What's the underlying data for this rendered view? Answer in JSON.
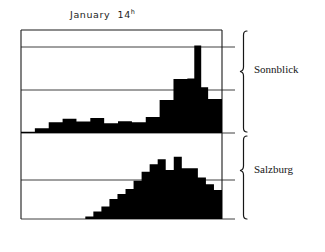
{
  "figure": {
    "title_main": "January",
    "title_day": "14",
    "title_sup": "h"
  },
  "panels": {
    "upper": {
      "label": "Sonnblick"
    },
    "lower": {
      "label": "Salzburg"
    }
  },
  "colors": {
    "bar_fill": "#000000",
    "frame": "#1a1a1a",
    "gridline": "#2b2b2b",
    "background": "#ffffff"
  },
  "chart_data": [
    {
      "type": "bar",
      "title": "January 14h",
      "series_name": "Sonnblick",
      "xlabel": "",
      "ylabel": "",
      "grid": true,
      "legend_position": "right",
      "ylim": [
        0,
        4
      ],
      "gridline_values": [
        1,
        3,
        4
      ],
      "categories": [
        "1",
        "2",
        "3",
        "4",
        "5",
        "6",
        "7",
        "8",
        "9",
        "10",
        "11",
        "12",
        "13",
        "14",
        "15",
        "16",
        "17",
        "18",
        "19",
        "20",
        "21",
        "22",
        "23",
        "24"
      ],
      "values": [
        0.05,
        0.05,
        0.18,
        0.18,
        0.42,
        0.42,
        0.55,
        0.55,
        0.45,
        0.45,
        0.58,
        0.58,
        0.38,
        0.38,
        0.46,
        0.46,
        0.42,
        0.42,
        0.62,
        0.62,
        1.28,
        1.28,
        2.1,
        2.1,
        2.12,
        3.4,
        1.78,
        1.32,
        1.32
      ]
    },
    {
      "type": "bar",
      "title": "January 14h",
      "series_name": "Salzburg",
      "xlabel": "",
      "ylabel": "",
      "grid": true,
      "legend_position": "right",
      "ylim": [
        0,
        2
      ],
      "gridline_values": [
        1.2
      ],
      "categories": [
        "1",
        "2",
        "3",
        "4",
        "5",
        "6",
        "7",
        "8",
        "9",
        "10",
        "11",
        "12",
        "13",
        "14",
        "15",
        "16",
        "17",
        "18",
        "19",
        "20",
        "21",
        "22",
        "23",
        "24"
      ],
      "values": [
        0,
        0,
        0,
        0,
        0,
        0,
        0,
        0,
        0.06,
        0.18,
        0.3,
        0.48,
        0.6,
        0.72,
        0.92,
        1.14,
        1.32,
        1.44,
        1.18,
        1.5,
        1.22,
        1.22,
        1.0,
        0.84,
        0.7
      ]
    }
  ]
}
